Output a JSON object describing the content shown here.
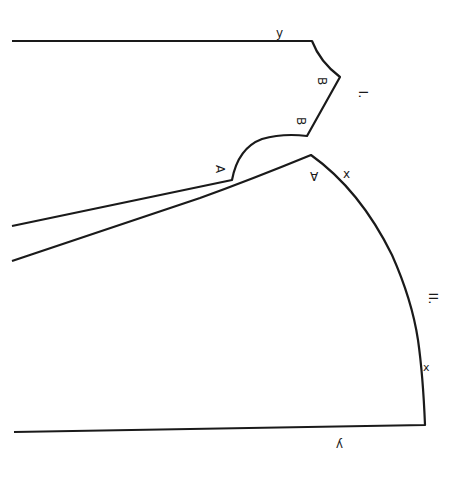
{
  "diagram": {
    "type": "sewing-pattern",
    "colors": {
      "ink": "#1a1a1a",
      "paper": "#ffffff"
    },
    "pieces": [
      {
        "id": "I",
        "label": "I."
      },
      {
        "id": "II",
        "label": "II."
      }
    ],
    "labels": {
      "piece1_y": "y",
      "piece1_b_upper": "B",
      "piece1_b_lower": "B",
      "piece1_roman": "I.",
      "piece1_a": "A",
      "piece2_a": "A",
      "piece2_x_upper": "x",
      "piece2_roman": "II.",
      "piece2_x_lower": "x",
      "piece2_y": "y"
    }
  }
}
